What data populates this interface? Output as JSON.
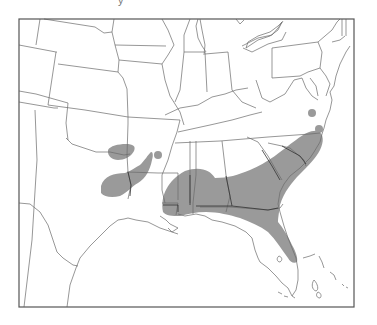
{
  "map": {
    "title": "",
    "caption_fragment": "y",
    "region": "Southeastern United States",
    "legend": [],
    "colors": {
      "range_fill": "#9a9a9a",
      "border_stroke": "#6a6a6a",
      "frame_stroke": "#555555",
      "background": "#ffffff"
    },
    "frame": {
      "left": 19,
      "top": 19,
      "right": 354,
      "bottom": 307
    },
    "shaded_areas": [
      {
        "name": "southeast-main-range",
        "description": "Gulf and Atlantic coastal plain from east Texas/Louisiana through Mississippi, Alabama, Georgia, South Carolina, North Carolina and north-central Florida"
      },
      {
        "name": "east-texas-louisiana-range",
        "description": "East Texas / northwest Louisiana"
      },
      {
        "name": "oklahoma-red-river-patch",
        "description": "South-central Oklahoma / north Texas"
      },
      {
        "name": "arkansas-dot",
        "description": "Southwest Arkansas small patch"
      },
      {
        "name": "virginia-dot",
        "description": "Southeast Virginia small patch"
      },
      {
        "name": "north-carolina-coast-dot",
        "description": "Coastal North Carolina small patch"
      }
    ]
  }
}
